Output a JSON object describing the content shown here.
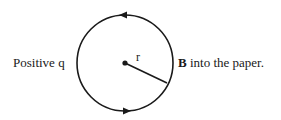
{
  "diagram": {
    "left_label": "Positive q",
    "right_label_bold": "B",
    "right_label_rest": " into the paper.",
    "radius_label": "r",
    "circle": {
      "cx": 125,
      "cy": 63,
      "r": 48
    },
    "arrows": [
      {
        "position": "top",
        "direction": "left"
      },
      {
        "position": "bottom",
        "direction": "right"
      }
    ],
    "colors": {
      "stroke": "#1a1a1a",
      "background": "#ffffff"
    }
  }
}
